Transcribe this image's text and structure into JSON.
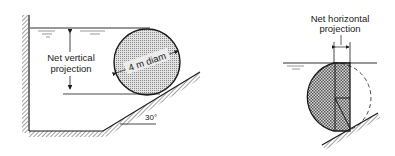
{
  "left_figure": {
    "label_line1": "Net vertical",
    "label_line2": "projection",
    "diameter_label": "4 m diam",
    "angle_label": "30°"
  },
  "right_figure": {
    "label_line1": "Net horizontal",
    "label_line2": "projection"
  },
  "colors": {
    "ink": "#1a1a1a",
    "stipple": "#9a9a9a",
    "background": "#ffffff"
  }
}
